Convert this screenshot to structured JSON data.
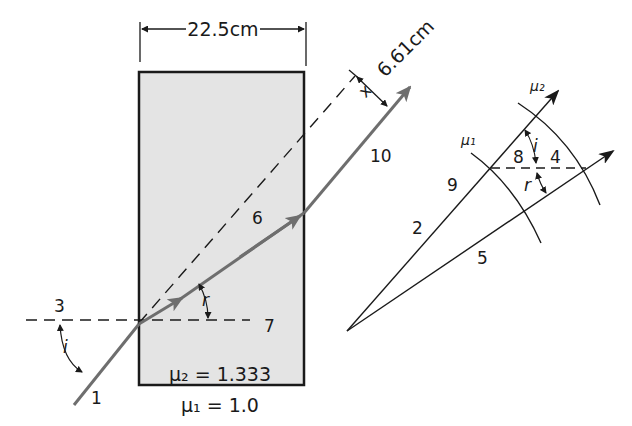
{
  "figure": {
    "colors": {
      "block_fill": "#e4e4e4",
      "block_stroke": "#1a1a1a",
      "ray": "#6e6e6e",
      "line": "#1a1a1a",
      "background": "#ffffff"
    }
  },
  "block": {
    "width_label": "22.5cm",
    "displacement_label": "6.61cm",
    "displacement_symbol": "x",
    "inner_medium_label": "μ₂ = 1.333",
    "outer_medium_label": "μ₁ = 1.0"
  },
  "angles": {
    "incidence": "i",
    "refraction": "r"
  },
  "callouts": {
    "c1": "1",
    "c2": "2",
    "c3": "3",
    "c4": "4",
    "c5": "5",
    "c6": "6",
    "c7": "7",
    "c8": "8",
    "c9": "9",
    "c10": "10"
  },
  "wavefront_diagram": {
    "arc_inner_label": "μ₁",
    "arc_outer_label": "μ₂",
    "angle_i": "i",
    "angle_r": "r"
  }
}
